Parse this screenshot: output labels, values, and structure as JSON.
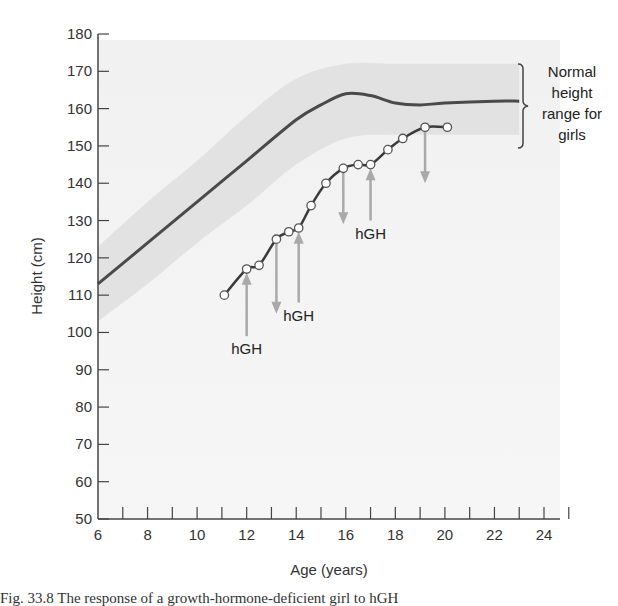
{
  "chart_data": {
    "type": "line",
    "title": "",
    "xlabel": "Age (years)",
    "ylabel": "Height (cm)",
    "xlim": [
      6,
      25
    ],
    "ylim": [
      50,
      180
    ],
    "x_ticks": [
      6,
      8,
      10,
      12,
      14,
      16,
      18,
      20,
      22,
      24
    ],
    "y_ticks": [
      50,
      60,
      70,
      80,
      90,
      100,
      110,
      120,
      130,
      140,
      150,
      160,
      170,
      180
    ],
    "grid": false,
    "normal_range_annotation": [
      "Normal",
      "height",
      "range for",
      "girls"
    ],
    "series": [
      {
        "name": "Normal mean height (girls)",
        "style": "solid line, no markers",
        "x": [
          6,
          8,
          10,
          12,
          14,
          15,
          16,
          17,
          18,
          19,
          20,
          22,
          23
        ],
        "y": [
          113,
          124,
          135,
          146,
          157,
          161,
          164,
          163.5,
          161.5,
          161,
          161.5,
          162,
          162
        ]
      },
      {
        "name": "Normal range band (girls)",
        "style": "shaded band",
        "x": [
          6,
          8,
          10,
          12,
          14,
          16,
          18,
          20,
          22,
          23
        ],
        "lower": [
          103,
          113,
          124,
          134,
          145,
          152,
          153,
          153,
          153,
          153
        ],
        "upper": [
          123,
          135,
          146,
          158,
          168,
          172,
          172,
          172,
          172,
          172
        ]
      },
      {
        "name": "Patient height",
        "style": "line with open circle markers",
        "x": [
          11.1,
          12.0,
          12.5,
          13.2,
          13.7,
          14.1,
          14.6,
          15.2,
          15.9,
          16.5,
          17.0,
          17.7,
          18.3,
          19.2,
          20.1
        ],
        "y": [
          110,
          117,
          118,
          125,
          127,
          128,
          134,
          140,
          144,
          145,
          145,
          149,
          152,
          155,
          155
        ]
      }
    ],
    "annotations": [
      {
        "type": "arrow-up",
        "x": 12.0,
        "from_y": 99,
        "to_y": 116,
        "label": "hGH"
      },
      {
        "type": "arrow-down",
        "x": 13.2,
        "from_y": 124,
        "to_y": 105,
        "label": ""
      },
      {
        "type": "arrow-up",
        "x": 14.1,
        "from_y": 108,
        "to_y": 127,
        "label": "hGH"
      },
      {
        "type": "arrow-down",
        "x": 15.9,
        "from_y": 143,
        "to_y": 129,
        "label": ""
      },
      {
        "type": "arrow-up",
        "x": 17.0,
        "from_y": 130,
        "to_y": 144,
        "label": "hGH"
      },
      {
        "type": "arrow-down",
        "x": 19.2,
        "from_y": 154,
        "to_y": 140,
        "label": ""
      }
    ]
  },
  "caption": "Fig. 33.8  The response of a growth-hormone-deficient girl to hGH"
}
